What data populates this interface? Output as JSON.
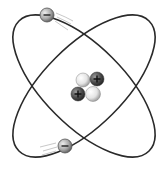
{
  "diagram": {
    "title": "Atom model",
    "orbits": [
      {
        "name": "orbit-a",
        "rotation": 45
      },
      {
        "name": "orbit-b",
        "rotation": -45
      }
    ],
    "nucleus": {
      "particles": [
        {
          "type": "neutron",
          "symbol": ""
        },
        {
          "type": "proton",
          "symbol": "+"
        },
        {
          "type": "proton",
          "symbol": "+"
        },
        {
          "type": "neutron",
          "symbol": ""
        }
      ]
    },
    "electrons": [
      {
        "symbol": "−",
        "position": "top-left"
      },
      {
        "symbol": "−",
        "position": "bottom-left"
      }
    ],
    "colors": {
      "orbit": "#2a2a2a",
      "proton": "#4a4a4a",
      "neutron": "#e8e8e8",
      "electron": "#a8a8a8",
      "motion_lines": "#b0b0b0"
    }
  }
}
